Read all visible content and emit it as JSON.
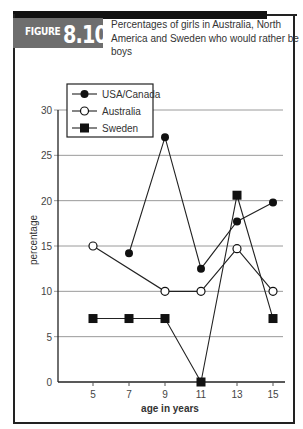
{
  "figure": {
    "label_word": "FIGURE",
    "label_number": "8.10",
    "title": "Percentages of girls in Australia, North America and Sweden who would rather be boys"
  },
  "colors": {
    "frame": "#222222",
    "label_bg": "#6e6e6e",
    "gridline": "#9a9a9a",
    "series_line": "#222222"
  },
  "chart_data": {
    "type": "line",
    "title": "Percentages of girls in Australia, North America and Sweden who would rather be boys",
    "xlabel": "age in years",
    "ylabel": "percentage",
    "x": [
      5,
      7,
      9,
      11,
      13,
      15
    ],
    "xticks": [
      5,
      7,
      9,
      11,
      13,
      15
    ],
    "yticks": [
      0,
      5,
      10,
      15,
      20,
      25,
      30
    ],
    "ylim": [
      0,
      30
    ],
    "grid": "horizontal",
    "legend_position": "upper left",
    "series": [
      {
        "name": "USA/Canada",
        "marker": "filled-circle",
        "x": [
          7,
          9,
          11,
          13,
          15
        ],
        "values": [
          14.2,
          27,
          12.5,
          17.7,
          19.8
        ]
      },
      {
        "name": "Australia",
        "marker": "open-circle",
        "x": [
          5,
          9,
          11,
          13,
          15
        ],
        "values": [
          15,
          10,
          10,
          14.7,
          10
        ]
      },
      {
        "name": "Sweden",
        "marker": "filled-square",
        "x": [
          5,
          7,
          9,
          11,
          13,
          15
        ],
        "values": [
          7,
          7,
          7,
          0,
          20.6,
          7
        ]
      }
    ]
  }
}
